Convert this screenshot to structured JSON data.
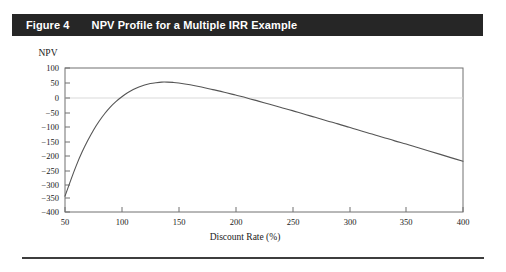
{
  "figure": {
    "number_label": "Figure 4",
    "title": "NPV Profile for a Multiple IRR Example"
  },
  "chart_data": {
    "type": "line",
    "title": "NPV Profile for a Multiple IRR Example",
    "xlabel": "Discount Rate (%)",
    "ylabel": "NPV",
    "xlim": [
      50,
      400
    ],
    "ylim": [
      -400,
      100
    ],
    "grid": false,
    "legend": "none",
    "zero_line": true,
    "xticks": [
      50,
      100,
      150,
      200,
      250,
      300,
      350,
      400
    ],
    "xtick_labels": [
      "50",
      "100",
      "150",
      "200",
      "250",
      "300",
      "350",
      "400"
    ],
    "yticks": [
      100,
      50,
      0,
      -50,
      -100,
      -150,
      -200,
      -250,
      -300,
      -350,
      -400
    ],
    "ytick_labels": [
      "100",
      "50",
      "0",
      "−50",
      "−100",
      "−150",
      "−200",
      "−250",
      "−300",
      "−350",
      "−400"
    ],
    "series": [
      {
        "name": "NPV",
        "color": "#555555",
        "x": [
          50,
          55,
          60,
          65,
          70,
          75,
          80,
          85,
          90,
          95,
          100,
          105,
          110,
          115,
          120,
          125,
          130,
          135,
          140,
          145,
          150,
          160,
          170,
          180,
          190,
          200,
          210,
          220,
          230,
          240,
          250,
          260,
          270,
          280,
          290,
          300,
          310,
          320,
          330,
          340,
          350,
          360,
          370,
          380,
          390,
          400
        ],
        "y": [
          -345,
          -290,
          -238,
          -192,
          -152,
          -116,
          -85,
          -58,
          -35,
          -16,
          0,
          14,
          25,
          34,
          41,
          46,
          49,
          51,
          51,
          50,
          48,
          42,
          34,
          25,
          16,
          6,
          -4,
          -15,
          -26,
          -37,
          -48,
          -60,
          -71,
          -83,
          -94,
          -106,
          -118,
          -129,
          -141,
          -153,
          -164,
          -176,
          -188,
          -200,
          -212,
          -224
        ]
      }
    ],
    "annotations": {
      "approx_irr_low": 100,
      "approx_irr_high": 205,
      "peak_npv": 51,
      "peak_discount_rate": 138
    }
  }
}
